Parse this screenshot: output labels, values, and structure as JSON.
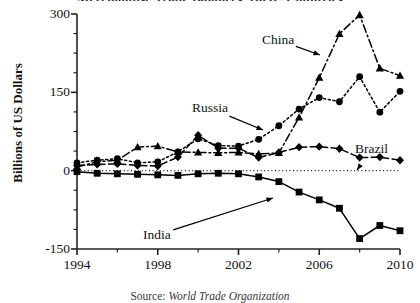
{
  "chart_data": {
    "type": "line",
    "title": "Merchandise Trade Balances, BRIC Countries",
    "ylabel": "Billions of US Dollars",
    "xlabel": "",
    "source": "Source: World Trade Organization",
    "source_prefix": "Source:",
    "source_body": " World Trade Organization",
    "grid": false,
    "legend_position": "inline-annotations",
    "xlim": [
      1994,
      2010
    ],
    "ylim": [
      -150,
      300
    ],
    "ytick_labels": [
      "300",
      "150",
      "0",
      "-150"
    ],
    "ytick_values": [
      300,
      150,
      0,
      -150
    ],
    "yminor_step": 37.5,
    "xtick_labels": [
      "1994",
      "1998",
      "2002",
      "2006",
      "2010"
    ],
    "xtick_values": [
      1994,
      1998,
      2002,
      2006,
      2010
    ],
    "x": [
      1994,
      1995,
      1996,
      1997,
      1998,
      1999,
      2000,
      2001,
      2002,
      2003,
      2004,
      2005,
      2006,
      2007,
      2008,
      2009,
      2010
    ],
    "series": [
      {
        "name": "China",
        "marker": "triangle",
        "line_style": "dash-dot",
        "color": "#000000",
        "values": [
          7,
          17,
          20,
          45,
          47,
          36,
          35,
          34,
          35,
          32,
          34,
          102,
          178,
          262,
          298,
          196,
          182
        ]
      },
      {
        "name": "Russia",
        "marker": "circle",
        "line_style": "dotted",
        "color": "#000000",
        "values": [
          15,
          20,
          23,
          15,
          17,
          36,
          61,
          48,
          47,
          60,
          86,
          118,
          140,
          132,
          180,
          112,
          152
        ]
      },
      {
        "name": "Brazil",
        "marker": "diamond",
        "line_style": "dashed",
        "color": "#000000",
        "values": [
          10,
          12,
          13,
          10,
          9,
          26,
          68,
          43,
          43,
          25,
          35,
          45,
          46,
          42,
          25,
          26,
          20
        ]
      },
      {
        "name": "India",
        "marker": "square",
        "line_style": "solid",
        "color": "#000000",
        "values": [
          -2,
          -5,
          -6,
          -7,
          -8,
          -9,
          -6,
          -5,
          -6,
          -12,
          -21,
          -41,
          -56,
          -72,
          -130,
          -105,
          -115
        ]
      }
    ],
    "annotations": [
      {
        "label": "China",
        "x_px": 262,
        "y_px": 33,
        "arrow_to_x": 320,
        "arrow_to_y": 55
      },
      {
        "label": "Russia",
        "x_px": 192,
        "y_px": 101,
        "arrow_to_x": 263,
        "arrow_to_y": 130
      },
      {
        "label": "Brazil",
        "x_px": 355,
        "y_px": 142,
        "arrow_to_x": 357,
        "arrow_to_y": 170
      },
      {
        "label": "India",
        "x_px": 143,
        "y_px": 228,
        "arrow_to_x": 273,
        "arrow_to_y": 198
      }
    ]
  }
}
